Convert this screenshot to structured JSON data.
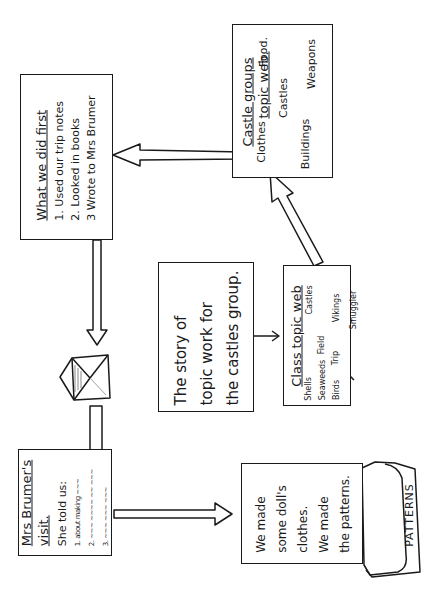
{
  "diagram": {
    "orientation": "rotated 90° counter-clockwise",
    "center": {
      "lines": [
        "The story of",
        "topic work for",
        "the castles group."
      ]
    },
    "class_topic_web": {
      "title": "Class topic web",
      "hubs": [
        "Field",
        "Trip"
      ],
      "nodes": [
        "Shells",
        "Castles",
        "Seaweeds",
        "Vikings",
        "Birds",
        "Smuggler"
      ]
    },
    "castle_groups": {
      "title_line1": "Castle groups",
      "title_line2": "topic web.",
      "hub": "Castles",
      "nodes": [
        "Clothes",
        "Food.",
        "Weapons",
        "Buildings"
      ]
    },
    "what_we_did_first": {
      "title": "What we did first",
      "items": [
        "1. Used our trip notes",
        "2. Looked in books",
        "3 Wrote to Mrs Brumer"
      ]
    },
    "envelope": {
      "icon": "envelope-icon"
    },
    "mrs_brumers_visit": {
      "title_line1": "Mrs Brumer's",
      "title_line2": "visit.",
      "intro": "She told us:",
      "items": [
        "1. about making ~~~",
        "2. ~~~ ~~~~ ~~ ~~~",
        "3. ~~~ ~~~ ~~~"
      ]
    },
    "dolls_clothes": {
      "lines": [
        "We made",
        "some doll's",
        "clothes.",
        "We made",
        "the patterns."
      ],
      "folder_label": "PATTERNS"
    },
    "colors": {
      "ink": "#1a1a1a",
      "paper": "#ffffff"
    }
  }
}
